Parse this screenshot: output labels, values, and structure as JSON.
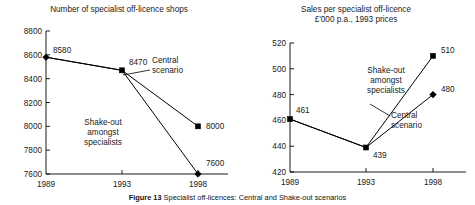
{
  "figure": {
    "caption_label": "Figure 13",
    "caption_text": "Specialist off-licences: Central and Shake-out scenarios"
  },
  "chart_data": [
    {
      "id": "left",
      "type": "line",
      "title": "Number of specialist off-licence shops",
      "subtitle": "",
      "xlabel": "",
      "ylabel": "",
      "x": [
        "1989",
        "1993",
        "1998"
      ],
      "xticks": [
        "1989",
        "1993",
        "1998"
      ],
      "yticks": [
        7600,
        7800,
        8000,
        8200,
        8400,
        8600,
        8800
      ],
      "ylim": [
        7600,
        8800
      ],
      "grid": false,
      "legend": "none",
      "annotations": [
        {
          "name": "central-scenario",
          "text": [
            "Central",
            "scenario"
          ]
        },
        {
          "name": "shake-out",
          "text": [
            "Shake-out",
            "amongst",
            "specialists"
          ]
        }
      ],
      "series": [
        {
          "name": "Central scenario",
          "marker": "square",
          "points": [
            {
              "x": "1989",
              "y": 8580,
              "label": "8580",
              "marker": "diamond"
            },
            {
              "x": "1993",
              "y": 8470,
              "label": "8470",
              "marker": "square"
            },
            {
              "x": "1998",
              "y": 8000,
              "label": "8000",
              "marker": "square"
            }
          ]
        },
        {
          "name": "Shake-out amongst specialists",
          "marker": "diamond",
          "points": [
            {
              "x": "1989",
              "y": 8580,
              "label": "8580",
              "marker": "diamond"
            },
            {
              "x": "1993",
              "y": 8470,
              "label": "8470",
              "marker": "square"
            },
            {
              "x": "1998",
              "y": 7600,
              "label": "7600",
              "marker": "diamond"
            }
          ]
        }
      ]
    },
    {
      "id": "right",
      "type": "line",
      "title": "Sales per specialist off-licence",
      "subtitle": "£'000 p.a., 1993 prices",
      "xlabel": "",
      "ylabel": "",
      "x": [
        "1989",
        "1993",
        "1998"
      ],
      "xticks": [
        "1989",
        "1993",
        "1998"
      ],
      "yticks": [
        420,
        440,
        460,
        480,
        500,
        520
      ],
      "ylim": [
        420,
        520
      ],
      "grid": false,
      "legend": "none",
      "annotations": [
        {
          "name": "shake-out",
          "text": [
            "Shake-out",
            "amongst",
            "specialists"
          ]
        },
        {
          "name": "central-scenario",
          "text": [
            "Central",
            "scenario"
          ]
        }
      ],
      "series": [
        {
          "name": "Shake-out amongst specialists",
          "marker": "square",
          "points": [
            {
              "x": "1989",
              "y": 461,
              "label": "461",
              "marker": "square"
            },
            {
              "x": "1993",
              "y": 439,
              "label": "439",
              "marker": "square"
            },
            {
              "x": "1998",
              "y": 510,
              "label": "510",
              "marker": "square"
            }
          ]
        },
        {
          "name": "Central scenario",
          "marker": "diamond",
          "points": [
            {
              "x": "1989",
              "y": 461,
              "label": "461",
              "marker": "square"
            },
            {
              "x": "1993",
              "y": 439,
              "label": "439",
              "marker": "square"
            },
            {
              "x": "1998",
              "y": 480,
              "label": "480",
              "marker": "diamond"
            }
          ]
        }
      ]
    }
  ],
  "colors": {
    "ink": "#000000",
    "background": "#ffffff"
  }
}
